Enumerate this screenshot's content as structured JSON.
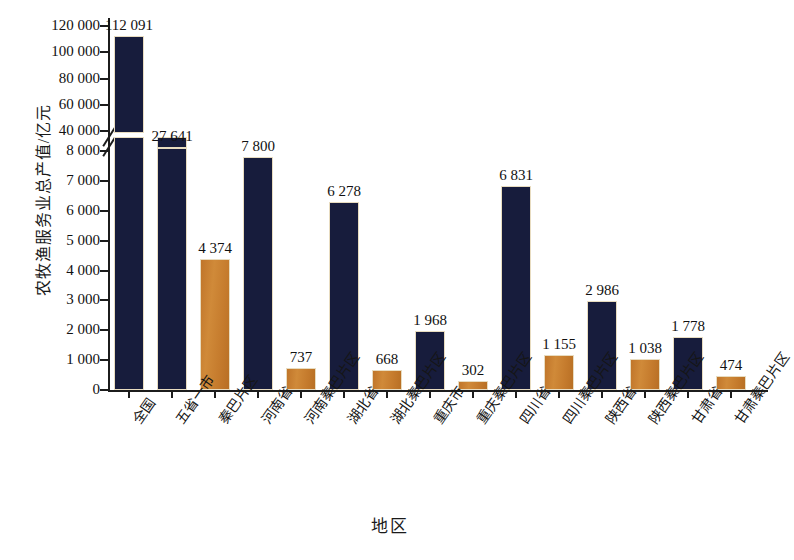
{
  "chart_data": {
    "type": "bar",
    "title": "",
    "xlabel": "地区",
    "ylabel": "农牧渔服务业总产值/亿元",
    "grid": false,
    "legend": "none",
    "broken_axis": true,
    "axis_lower": {
      "min": 0,
      "max": 8000,
      "step": 1000,
      "ticks": [
        "0",
        "1 000",
        "2 000",
        "3 000",
        "4 000",
        "5 000",
        "6 000",
        "7 000",
        "8 000"
      ]
    },
    "axis_upper": {
      "min": 40000,
      "max": 120000,
      "step": 20000,
      "ticks": [
        "40 000",
        "60 000",
        "80 000",
        "100 000",
        "120 000"
      ]
    },
    "categories": [
      "全国",
      "五省一市",
      "秦巴片区",
      "河南省",
      "河南秦巴片区",
      "湖北省",
      "湖北秦巴片区",
      "重庆市",
      "重庆秦巴片区",
      "四川省",
      "四川秦巴片区",
      "陕西省",
      "陕西秦巴片区",
      "甘肃省",
      "甘肃秦巴片区"
    ],
    "values": [
      112091,
      27641,
      4374,
      7800,
      737,
      6278,
      668,
      1968,
      302,
      6831,
      1155,
      2986,
      1038,
      1778,
      474
    ],
    "value_labels": [
      "112 091",
      "27 641",
      "4 374",
      "7 800",
      "737",
      "6 278",
      "668",
      "1 968",
      "302",
      "6 831",
      "1 155",
      "2 986",
      "1 038",
      "1 778",
      "474"
    ],
    "series_colors": {
      "region_total": "#171c3c",
      "qinba_area": "#c57b2d"
    },
    "bar_kinds": [
      "region_total",
      "region_total",
      "qinba_area",
      "region_total",
      "qinba_area",
      "region_total",
      "qinba_area",
      "region_total",
      "qinba_area",
      "region_total",
      "qinba_area",
      "region_total",
      "qinba_area",
      "region_total",
      "qinba_area"
    ]
  }
}
